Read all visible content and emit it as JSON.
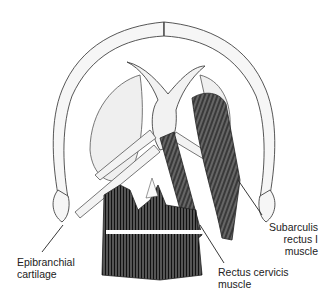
{
  "figure": {
    "colors": {
      "line": "#333333",
      "muscle_dark": "#2a2a2a",
      "cartilage_fill": "#f4f4f4",
      "background": "#ffffff"
    }
  },
  "labels": {
    "epibranchial": {
      "line1": "Epibranchial",
      "line2": "cartilage"
    },
    "subarculis": {
      "line1": "Subarculis",
      "line2": "rectus I",
      "line3": "muscle"
    },
    "rectus_cervicis": {
      "line1": "Rectus cervicis",
      "line2": "muscle"
    }
  }
}
